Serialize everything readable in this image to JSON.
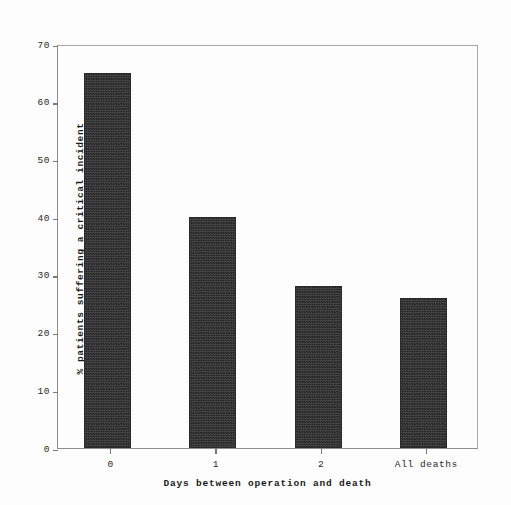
{
  "chart_data": {
    "type": "bar",
    "title": "",
    "subtitle": "",
    "xlabel": "Days between operation and death",
    "ylabel": "% patients suffering a critical incident",
    "categories": [
      "0",
      "1",
      "2",
      "All deaths"
    ],
    "values": [
      65,
      40,
      28,
      26
    ],
    "ylim": [
      0,
      70
    ],
    "yticks": [
      "0",
      "10",
      "20",
      "30",
      "40",
      "50",
      "60",
      "70"
    ],
    "ytick_values": [
      0,
      10,
      20,
      30,
      40,
      50,
      60,
      70
    ],
    "grid": false,
    "legend": null,
    "legend_position": "none",
    "bar_color": "#3a3a3a",
    "bar_edge_color": "#2a2a2a",
    "axis_color": "#8d8d8d",
    "background_color": "#fdfdfd",
    "annotations": []
  }
}
